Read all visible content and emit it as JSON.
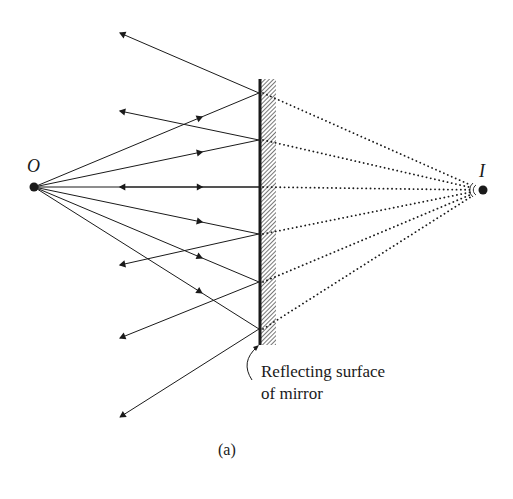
{
  "figure": {
    "caption": "(a)",
    "object_label": "O",
    "image_label": "I",
    "annotation": {
      "line1": "Reflecting surface",
      "line2": "of mirror"
    }
  },
  "geometry": {
    "object_point": [
      34,
      187
    ],
    "image_point": [
      482,
      190
    ],
    "mirror": {
      "x": 259,
      "top": 79,
      "bottom": 345,
      "hatch_width": 17
    },
    "reflection_points_y": [
      93,
      140,
      187,
      234,
      282,
      329
    ],
    "reflected_ray_tips": [
      [
        120,
        33
      ],
      [
        120,
        111
      ],
      [
        120,
        187
      ],
      [
        120,
        265
      ],
      [
        120,
        338
      ],
      [
        120,
        417
      ]
    ]
  },
  "colors": {
    "ink": "#1a1a1a",
    "background": "#ffffff"
  }
}
